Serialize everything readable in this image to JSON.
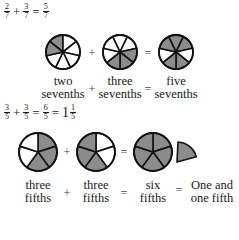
{
  "colors": {
    "shaded": "#8c8c8c",
    "empty": "#ffffff",
    "stroke": "#111111"
  },
  "example1": {
    "equation": {
      "a": {
        "num": "2",
        "den": "7"
      },
      "op1": "+",
      "b": {
        "num": "3",
        "den": "7"
      },
      "op2": "=",
      "c": {
        "num": "5",
        "den": "7"
      }
    },
    "wheels": [
      {
        "segments": 7,
        "shaded": [
          0,
          6
        ],
        "label_line1": "two",
        "label_line2": "sevenths"
      },
      {
        "segments": 7,
        "shaded": [
          2,
          3,
          4
        ],
        "label_line1": "three",
        "label_line2": "sevenths"
      },
      {
        "segments": 7,
        "shaded": [
          0,
          1,
          3,
          4,
          6
        ],
        "label_line1": "five",
        "label_line2": "sevenths"
      }
    ],
    "plus": "+",
    "equals": "="
  },
  "example2": {
    "equation": {
      "a": {
        "num": "3",
        "den": "5"
      },
      "op1": "+",
      "b": {
        "num": "3",
        "den": "5"
      },
      "op2": "=",
      "c": {
        "num": "6",
        "den": "5"
      },
      "op3": "=",
      "whole": "1",
      "d": {
        "num": "1",
        "den": "5"
      }
    },
    "wheels": [
      {
        "segments": 5,
        "shaded": [
          0,
          1,
          2
        ],
        "label_line1": "three",
        "label_line2": "fifths"
      },
      {
        "segments": 5,
        "shaded": [
          2,
          3,
          4
        ],
        "label_line1": "three",
        "label_line2": "fifths"
      },
      {
        "segments": 5,
        "shaded": [
          0,
          1,
          2,
          3,
          4
        ],
        "label_line1": "six",
        "label_line2": "fifths"
      }
    ],
    "extra_piece": {
      "segments": 5,
      "shaded": 1
    },
    "plus": "+",
    "equals": "=",
    "result_line1": "One and",
    "result_line2": "one fifth"
  }
}
